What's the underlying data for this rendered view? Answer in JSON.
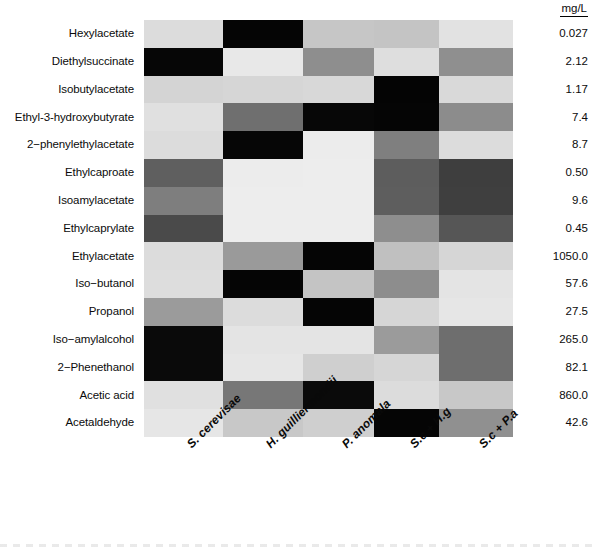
{
  "figure": {
    "title": "",
    "units_header": "mg/L"
  },
  "rows": [
    "Hexylacetate",
    "Diethylsuccinate",
    "Isobutylacetate",
    "Ethyl-3-hydroxybutyrate",
    "2−phenylethylacetate",
    "Ethylcaproate",
    "Isoamylacetate",
    "Ethylcaprylate",
    "Ethylacetate",
    "Iso−butanol",
    "Propanol",
    "Iso−amylalcohol",
    "2−Phenethanol",
    "Acetic acid",
    "Acetaldehyde"
  ],
  "columns": [
    "S. cerevisae",
    "H. guilliermondii",
    "P. anomala",
    "S.c + H.g",
    "S.c + P.a"
  ],
  "values": [
    "0.027",
    "2.12",
    "1.17",
    "7.4",
    "8.7",
    "0.50",
    "9.6",
    "0.45",
    "1050.0",
    "57.6",
    "27.5",
    "265.0",
    "82.1",
    "860.0",
    "42.6"
  ],
  "chart_data": {
    "type": "heatmap",
    "title": "",
    "xlabel": "",
    "ylabel": "",
    "colorscale": "grayscale: light = low, black = high",
    "units": "mg/L",
    "categories_x": [
      "S. cerevisae",
      "H. guilliermondii",
      "P. anomala",
      "S.c + H.g",
      "S.c + P.a"
    ],
    "categories_y": [
      "Hexylacetate",
      "Diethylsuccinate",
      "Isobutylacetate",
      "Ethyl-3-hydroxybutyrate",
      "2−phenylethylacetate",
      "Ethylcaproate",
      "Isoamylacetate",
      "Ethylcaprylate",
      "Ethylacetate",
      "Iso−butanol",
      "Propanol",
      "Iso−amylalcohol",
      "2−Phenethanol",
      "Acetic acid",
      "Acetaldehyde"
    ],
    "row_totals_mgL": [
      0.027,
      2.12,
      1.17,
      7.4,
      8.7,
      0.5,
      9.6,
      0.45,
      1050.0,
      57.6,
      27.5,
      265.0,
      82.1,
      860.0,
      42.6
    ],
    "grid_hex": [
      [
        "#dcdcdc",
        "#050505",
        "#c6c6c6",
        "#c4c4c4",
        "#e2e2e2"
      ],
      [
        "#060606",
        "#e8e8e8",
        "#8e8e8e",
        "#dedede",
        "#8f8f8f"
      ],
      [
        "#d4d4d4",
        "#d6d6d6",
        "#d8d8d8",
        "#040404",
        "#d9d9d9"
      ],
      [
        "#e0e0e0",
        "#6f6f6f",
        "#070707",
        "#050505",
        "#8c8c8c"
      ],
      [
        "#dcdcdc",
        "#060606",
        "#ececec",
        "#7f7f7f",
        "#dcdcdc"
      ],
      [
        "#5f5f5f",
        "#ececec",
        "#ededed",
        "#5d5d5d",
        "#3e3e3e"
      ],
      [
        "#7e7e7e",
        "#ededed",
        "#ededed",
        "#5e5e5e",
        "#3f3f3f"
      ],
      [
        "#4a4a4a",
        "#ededed",
        "#ededed",
        "#8e8e8e",
        "#565656"
      ],
      [
        "#dcdcdc",
        "#9a9a9a",
        "#050505",
        "#c0c0c0",
        "#d6d6d6"
      ],
      [
        "#dddddd",
        "#050505",
        "#c4c4c4",
        "#8d8d8d",
        "#e4e4e4"
      ],
      [
        "#9b9b9b",
        "#dcdcdc",
        "#050505",
        "#d6d6d6",
        "#e6e6e6"
      ],
      [
        "#0a0a0a",
        "#e4e4e4",
        "#e4e4e4",
        "#9b9b9b",
        "#6e6e6e"
      ],
      [
        "#0a0a0a",
        "#e6e6e6",
        "#cfcfcf",
        "#d6d6d6",
        "#6e6e6e"
      ],
      [
        "#e0e0e0",
        "#777777",
        "#0a0a0a",
        "#dcdcdc",
        "#c8c8c8"
      ],
      [
        "#e6e6e6",
        "#c8c8c8",
        "#cfcfcf",
        "#050505",
        "#909090"
      ]
    ],
    "grid_intensity_0to1": [
      [
        0.14,
        0.98,
        0.22,
        0.23,
        0.11
      ],
      [
        0.98,
        0.09,
        0.44,
        0.13,
        0.44
      ],
      [
        0.17,
        0.16,
        0.15,
        0.98,
        0.15
      ],
      [
        0.12,
        0.56,
        0.97,
        0.98,
        0.45
      ],
      [
        0.14,
        0.98,
        0.07,
        0.5,
        0.14
      ],
      [
        0.63,
        0.07,
        0.07,
        0.64,
        0.76
      ],
      [
        0.51,
        0.07,
        0.07,
        0.63,
        0.75
      ],
      [
        0.71,
        0.07,
        0.07,
        0.44,
        0.66
      ],
      [
        0.14,
        0.4,
        0.98,
        0.25,
        0.16
      ],
      [
        0.13,
        0.98,
        0.23,
        0.45,
        0.11
      ],
      [
        0.39,
        0.14,
        0.98,
        0.16,
        0.1
      ],
      [
        0.96,
        0.11,
        0.11,
        0.39,
        0.57
      ],
      [
        0.96,
        0.1,
        0.19,
        0.16,
        0.57
      ],
      [
        0.12,
        0.53,
        0.96,
        0.14,
        0.22
      ],
      [
        0.1,
        0.22,
        0.19,
        0.98,
        0.44
      ]
    ]
  }
}
